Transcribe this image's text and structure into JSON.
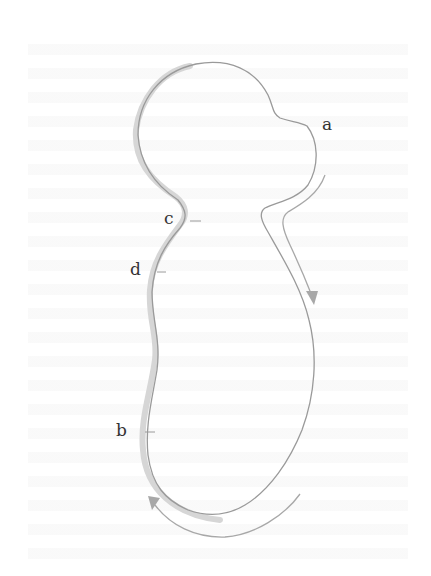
{
  "diagram": {
    "labels": {
      "a": "a",
      "b": "b",
      "c": "c",
      "d": "d"
    },
    "colors": {
      "outline": "#9a9a9a",
      "shading": "#d4d4d4",
      "arrow": "#a8a8a8",
      "label": "#333333",
      "background": "#ffffff"
    },
    "arrows": [
      {
        "name": "flow-arrow-right",
        "direction": "down",
        "side": "right"
      },
      {
        "name": "flow-arrow-bottom",
        "direction": "up-left",
        "side": "bottom-left"
      }
    ]
  }
}
